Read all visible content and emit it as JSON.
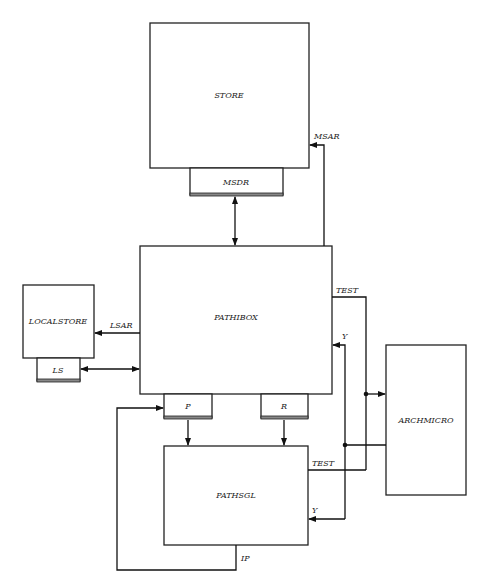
{
  "diagram": {
    "blocks": {
      "store": "STORE",
      "pathibox": "PATHIBOX",
      "localstore": "LOCALSTORE",
      "archmicro": "ARCHMICRO",
      "pathsgl": "PATHSGL"
    },
    "registers": {
      "msdr": "MSDR",
      "ls": "LS",
      "p": "P",
      "r": "R"
    },
    "signals": {
      "msar": "MSAR",
      "lsar": "LSAR",
      "test_top": "TEST",
      "y_top": "Y",
      "test_bottom": "TEST",
      "y_bottom": "Y",
      "ip": "IP"
    }
  }
}
